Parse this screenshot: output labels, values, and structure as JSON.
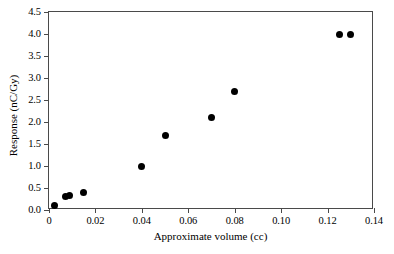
{
  "chart_data": {
    "type": "scatter",
    "title": "",
    "xlabel": "Approximate volume (cc)",
    "ylabel": "Response (nC/Gy)",
    "xlim": [
      0,
      0.14
    ],
    "ylim": [
      0.0,
      4.5
    ],
    "grid": false,
    "legend": null,
    "marker": "filled-circle",
    "marker_color": "#000000",
    "xticks": [
      0,
      0.02,
      0.04,
      0.06,
      0.08,
      0.1,
      0.12,
      0.14
    ],
    "xtick_labels": [
      "0",
      "0.02",
      "0.04",
      "0.06",
      "0.08",
      "0.10",
      "0.12",
      "0.14"
    ],
    "yticks": [
      0.0,
      0.5,
      1.0,
      1.5,
      2.0,
      2.5,
      3.0,
      3.5,
      4.0,
      4.5
    ],
    "ytick_labels": [
      "0.0",
      "0.5",
      "1.0",
      "1.5",
      "2.0",
      "2.5",
      "3.0",
      "3.5",
      "4.0",
      "4.5"
    ],
    "x": [
      0.0025,
      0.007,
      0.009,
      0.015,
      0.04,
      0.05,
      0.07,
      0.08,
      0.125,
      0.13
    ],
    "y": [
      0.1,
      0.3,
      0.32,
      0.4,
      1.0,
      1.7,
      2.1,
      2.7,
      4.0,
      4.0
    ],
    "points": [
      {
        "x": 0.0025,
        "y": 0.1
      },
      {
        "x": 0.007,
        "y": 0.3
      },
      {
        "x": 0.009,
        "y": 0.32
      },
      {
        "x": 0.015,
        "y": 0.4
      },
      {
        "x": 0.04,
        "y": 1.0
      },
      {
        "x": 0.05,
        "y": 1.7
      },
      {
        "x": 0.07,
        "y": 2.1
      },
      {
        "x": 0.08,
        "y": 2.7
      },
      {
        "x": 0.125,
        "y": 4.0
      },
      {
        "x": 0.13,
        "y": 4.0
      }
    ]
  },
  "colors": {
    "background": "#ffffff",
    "axis": "#4a4a4a",
    "marker": "#000000",
    "text": "#000000"
  }
}
